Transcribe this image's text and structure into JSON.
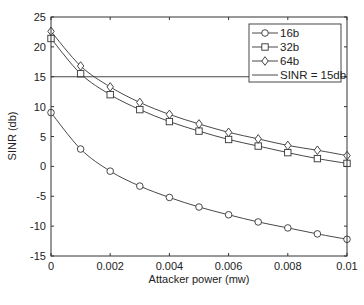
{
  "chart_data": {
    "type": "line",
    "title": "",
    "xlabel": "Attacker power (mw)",
    "ylabel": "SINR (db)",
    "xlim": [
      0,
      0.01
    ],
    "ylim": [
      -15,
      25
    ],
    "grid": false,
    "legend_position": "upper right",
    "x_ticks": [
      "0",
      "0.002",
      "0.004",
      "0.006",
      "0.008",
      "0.01"
    ],
    "x_tick_values": [
      0,
      0.002,
      0.004,
      0.006,
      0.008,
      0.01
    ],
    "y_ticks": [
      "-15",
      "-10",
      "-5",
      "0",
      "5",
      "10",
      "15",
      "20",
      "25"
    ],
    "y_tick_values": [
      -15,
      -10,
      -5,
      0,
      5,
      10,
      15,
      20,
      25
    ],
    "x": [
      0,
      0.001,
      0.002,
      0.003,
      0.004,
      0.005,
      0.006,
      0.007,
      0.008,
      0.009,
      0.01
    ],
    "series": [
      {
        "name": "16b",
        "marker": "circle",
        "values": [
          9.0,
          2.9,
          -0.8,
          -3.3,
          -5.2,
          -6.8,
          -8.1,
          -9.3,
          -10.3,
          -11.3,
          -12.2
        ]
      },
      {
        "name": "32b",
        "marker": "square",
        "values": [
          21.4,
          15.5,
          12.0,
          9.5,
          7.5,
          5.9,
          4.5,
          3.4,
          2.3,
          1.3,
          0.5
        ]
      },
      {
        "name": "64b",
        "marker": "diamond",
        "values": [
          22.6,
          16.8,
          13.3,
          10.7,
          8.7,
          7.1,
          5.7,
          4.6,
          3.5,
          2.7,
          1.8
        ]
      },
      {
        "name": "SINR = 15db",
        "marker": "none",
        "constant": 15
      }
    ],
    "colors": {
      "line": "#333333",
      "axis": "#333333",
      "background": "#ffffff"
    }
  }
}
